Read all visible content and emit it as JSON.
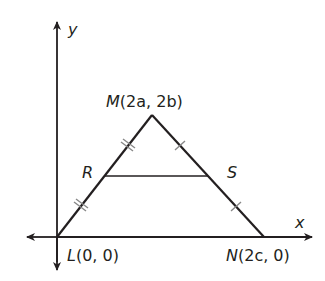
{
  "diagram": {
    "type": "coordinate-geometry",
    "axes": {
      "x_label": "x",
      "y_label": "y"
    },
    "points": {
      "L": {
        "name": "L",
        "coords": "(0, 0)"
      },
      "M": {
        "name": "M",
        "coords": "(2a, 2b)"
      },
      "N": {
        "name": "N",
        "coords": "(2c, 0)"
      },
      "R": {
        "name": "R"
      },
      "S": {
        "name": "S"
      }
    },
    "segments": [
      "LM",
      "MN",
      "LN",
      "RS"
    ],
    "congruence_marks": {
      "LR_MR": "double tick",
      "MS_SN": "single tick"
    },
    "line_color": "#231f20"
  }
}
